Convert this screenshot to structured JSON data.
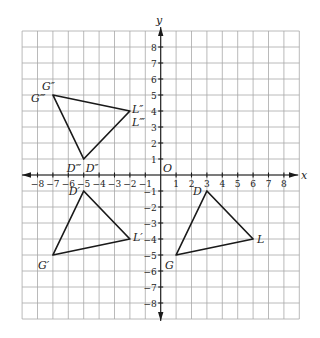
{
  "figure": {
    "type": "coordinate-plane-transformations",
    "x_axis_label": "x",
    "y_axis_label": "y",
    "origin_label": "O",
    "x_range": [
      -9,
      9
    ],
    "y_range": [
      -9,
      9
    ],
    "x_ticks": [
      -8,
      -7,
      -6,
      -5,
      -4,
      -3,
      -2,
      -1,
      1,
      2,
      3,
      4,
      5,
      6,
      7,
      8
    ],
    "y_ticks": [
      8,
      7,
      6,
      5,
      4,
      3,
      2,
      1,
      -1,
      -2,
      -3,
      -4,
      -5,
      -6,
      -7,
      -8
    ],
    "triangles": [
      {
        "name": "DLG",
        "vertices": [
          {
            "label": "D",
            "x": 3,
            "y": -1
          },
          {
            "label": "L",
            "x": 6,
            "y": -4
          },
          {
            "label": "G",
            "x": 1,
            "y": -5
          }
        ]
      },
      {
        "name": "D'L'G'",
        "vertices": [
          {
            "label": "D′",
            "x": -5,
            "y": -1
          },
          {
            "label": "L′",
            "x": -2,
            "y": -4
          },
          {
            "label": "G′",
            "x": -7,
            "y": -5
          }
        ]
      },
      {
        "name": "D''L''G''",
        "vertices": [
          {
            "label": "D″",
            "x": -5,
            "y": 1
          },
          {
            "label": "L″",
            "x": -2,
            "y": 4
          },
          {
            "label": "G″",
            "x": -7,
            "y": 5
          }
        ]
      }
    ],
    "extra_labels": [
      {
        "label": "G‴",
        "x": -7,
        "y": 5
      },
      {
        "label": "L‴",
        "x": -2,
        "y": 4
      },
      {
        "label": "D‴",
        "x": -5,
        "y": 1
      }
    ]
  }
}
